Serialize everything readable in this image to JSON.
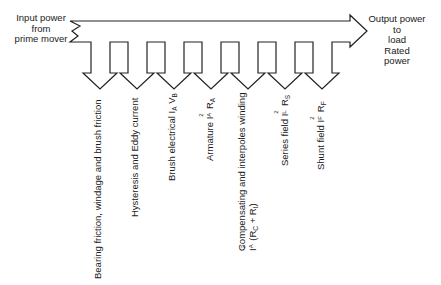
{
  "diagram": {
    "colors": {
      "line": "#222222",
      "text": "#1a1a1a",
      "background": "#ffffff"
    },
    "input": {
      "lines": [
        "Input power",
        "from",
        "prime mover"
      ]
    },
    "output": {
      "lines": [
        "Output power",
        "to",
        "load",
        "Rated",
        "power"
      ]
    },
    "losses": [
      {
        "id": "mechanical",
        "text": "Bearing friction, windage and brush friction"
      },
      {
        "id": "core",
        "text": "Hysteresis and Eddy current"
      },
      {
        "id": "brush",
        "text": "Brush electrical ",
        "sym1": "I",
        "sub1": "A",
        "sym2": " V",
        "sub2": "B"
      },
      {
        "id": "armature",
        "text": "Armature ",
        "sym1": "I",
        "sup1": "2",
        "sub1": "A",
        "sym2": " R",
        "sub2": "A"
      },
      {
        "id": "compensating",
        "text": "Compensating and interpoles winding",
        "line2_sym": "I",
        "line2_sup": "2",
        "line2_sub": "A",
        "line2_rest_a": " (R",
        "line2_sub_c": "C",
        "line2_rest_b": " + R",
        "line2_sub_i": "I",
        "line2_rest_c": ")"
      },
      {
        "id": "series",
        "text": "Series field ",
        "sym1": "I",
        "sup1": "2",
        "sub1": "L",
        "sym2": " R",
        "sub2": "S"
      },
      {
        "id": "shunt",
        "text": "Shunt field ",
        "sym1": "I",
        "sup1": "2",
        "sub1": "F",
        "sym2": " R",
        "sub2": "F"
      }
    ]
  }
}
